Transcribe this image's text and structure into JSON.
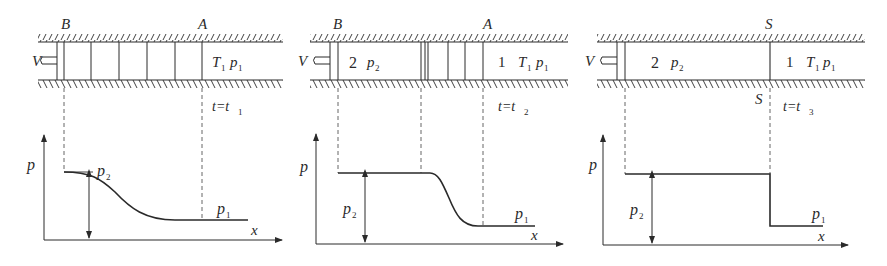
{
  "figure": {
    "panels": [
      {
        "id": "t1",
        "time_label": "t=t",
        "time_sub": "1",
        "piston_label": "V",
        "top_labels": [
          {
            "text": "B"
          },
          {
            "text": "A"
          }
        ],
        "region_right": {
          "T": "T",
          "T_sub": "1",
          "p": "p",
          "p_sub": "1"
        },
        "plot": {
          "ylabel": "p",
          "xlabel": "x",
          "p2_label": "p",
          "p2_sub": "2",
          "p1_label": "p",
          "p1_sub": "1"
        }
      },
      {
        "id": "t2",
        "time_label": "t=t",
        "time_sub": "2",
        "piston_label": "V",
        "top_labels": [
          {
            "text": "B"
          },
          {
            "text": "A"
          }
        ],
        "region_left": {
          "num": "2",
          "p": "p",
          "p_sub": "2"
        },
        "region_right": {
          "num": "1",
          "T": "T",
          "T_sub": "1",
          "p": "p",
          "p_sub": "1"
        },
        "plot": {
          "ylabel": "p",
          "xlabel": "x",
          "p2_label": "p",
          "p2_sub": "2",
          "p1_label": "p",
          "p1_sub": "1"
        }
      },
      {
        "id": "t3",
        "time_label": "t=t",
        "time_sub": "3",
        "piston_label": "V",
        "top_labels": [
          {
            "text": "S"
          }
        ],
        "bottom_label": "S",
        "region_left": {
          "num": "2",
          "p": "p",
          "p_sub": "2"
        },
        "region_right": {
          "num": "1",
          "T": "T",
          "T_sub": "1",
          "p": "p",
          "p_sub": "1"
        },
        "plot": {
          "ylabel": "p",
          "xlabel": "x",
          "p2_label": "p",
          "p2_sub": "2",
          "p1_label": "p",
          "p1_sub": "1"
        }
      }
    ],
    "colors": {
      "line": "#2a2a2a",
      "dash": "#555555"
    }
  }
}
